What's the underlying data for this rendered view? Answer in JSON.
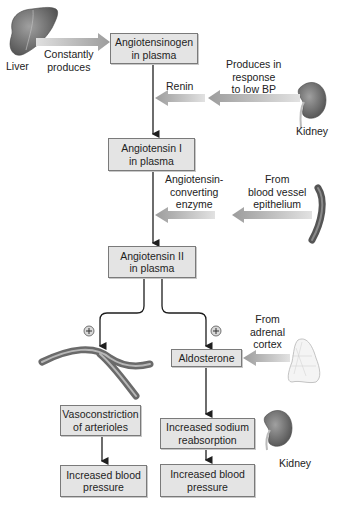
{
  "organs": {
    "liver": "Liver",
    "kidney_top": "Kidney",
    "kidney_bottom": "Kidney"
  },
  "labels": {
    "constantly_produces": [
      "Constantly",
      "produces"
    ],
    "renin_source": [
      "Produces in",
      "response",
      "to low BP"
    ],
    "renin": "Renin",
    "ace": [
      "Angiotensin-",
      "converting",
      "enzyme"
    ],
    "ace_source": [
      "From",
      "blood vessel",
      "epithelium"
    ],
    "aldosterone_source": [
      "From",
      "adrenal",
      "cortex"
    ],
    "plus_left": "+",
    "plus_right": "+"
  },
  "boxes": {
    "angiotensinogen": [
      "Angiotensinogen",
      "in plasma"
    ],
    "angiotensin_1": [
      "Angiotensin I",
      "in plasma"
    ],
    "angiotensin_2": [
      "Angiotensin II",
      "in plasma"
    ],
    "aldosterone": [
      "Aldosterone"
    ],
    "vasoconstriction": [
      "Vasoconstriction",
      "of arterioles"
    ],
    "sodium": [
      "Increased sodium",
      "reabsorption"
    ],
    "bp_left": [
      "Increased blood",
      "pressure"
    ],
    "bp_right": [
      "Increased blood",
      "pressure"
    ]
  },
  "colors": {
    "box_fill": "#e4e4e4",
    "box_border": "#7a7a7a",
    "wide_arrow": "#a8a8a8",
    "line": "#1e1e1e",
    "organ": "#6b6b6b"
  }
}
